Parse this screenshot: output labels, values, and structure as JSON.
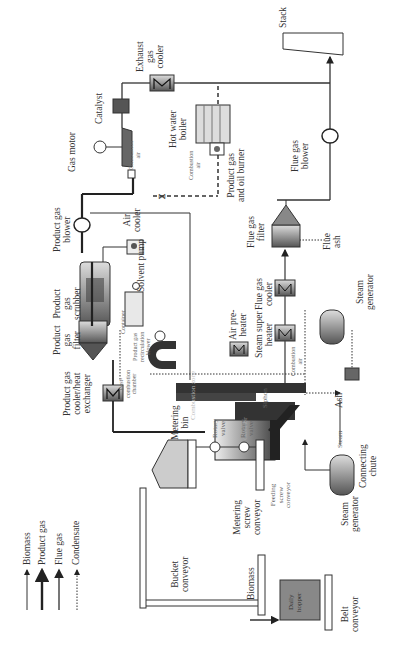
{
  "diagram": {
    "type": "process-flow",
    "orientation": "rotated-90-ccw",
    "legend": [
      {
        "label": "Biomass",
        "style": "thin-solid-arrow"
      },
      {
        "label": "Product gas",
        "style": "thick-solid-arrow"
      },
      {
        "label": "Flue gas",
        "style": "medium-solid-arrow"
      },
      {
        "label": "Condensate",
        "style": "dotted-arrow"
      }
    ],
    "labels": {
      "gas_motor": "Gas motor",
      "catalyst": "Catalyst",
      "exhaust_gas_cooler": "Exhaust\ngas\ncooler",
      "stack": "Stack",
      "hot_water_boiler": "Hot water\nboiler",
      "combustion_air_1": "Combustion\nair",
      "combustion_air_2": "Combustion\nair",
      "combustion_air_3": "Combustion\nair",
      "product_gas_oil_burner": "Product gas\nand oil burner",
      "flue_gas_blower": "Flue gas\nblower",
      "product_gas_blower": "Product gas\nblower",
      "air_cooler": "Air\ncooler",
      "solvent_pump": "Solvent pump",
      "product_gas_scrubber": "Product\ngas\nscrubber",
      "flue_gas_filter": "Flue gas\nfilter",
      "flue_ash": "Flue\nash",
      "container": "Container",
      "product_gas_recirculation_blower": "Product gas\nrecirculation\nblower",
      "product_gas_filter": "Product\ngas\nfilter",
      "air_preheater": "Air pre-\nheater",
      "steam_super_heater": "Steam super\nheater",
      "flue_gas_cooler": "Flue gas\ncooler",
      "steam_generator_top": "Steam\ngenerator",
      "product_gas_cooler": "Product gas\ncooler/heat\nexchanger",
      "post_combustion_chamber": "Post-\ncombustion\nchamber",
      "combustion_zone": "Combustion zone",
      "siphon": "Siphon",
      "gasifier": "Gasifier",
      "ash": "Ash",
      "metering_bin": "Metering\nbin",
      "rotary_valve_1": "Rotary\nvalve",
      "rotary_valve_2": "Rotary\nvalve",
      "metering_screw_conveyor": "Metering\nscrew\nconveyor",
      "feeding_screw_conveyor": "Feeding\nscrew\nconveyor",
      "steam": "Steam",
      "connecting_chute": "Connecting\nchute",
      "steam_generator_bottom": "Steam\ngenerator",
      "bucket_conveyor": "Bucket\nconveyor",
      "biomass_input": "Biomass",
      "daily_hopper": "Daily\nhopper",
      "belt_conveyor": "Belt\nconveyor"
    },
    "colors": {
      "line": "#222222",
      "equipment_dark": "#333333",
      "equipment_mid": "#777777",
      "equipment_light": "#cccccc"
    }
  }
}
